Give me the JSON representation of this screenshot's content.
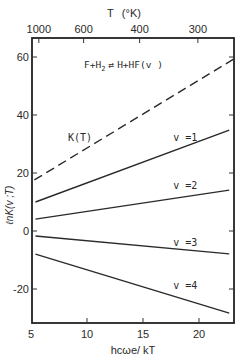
{
  "chart_data": {
    "type": "line",
    "xlabel": "hcωe/ kT",
    "ylabel": "ℓnK(v ;T)",
    "top_axis_label": "T  (°K)",
    "xlim": [
      5,
      23.1
    ],
    "ylim": [
      -34,
      66.5
    ],
    "grid": false,
    "legend": "inline labels",
    "x_ticks": [
      5,
      10,
      15,
      20
    ],
    "y_ticks": [
      -20,
      0,
      20,
      40,
      60
    ],
    "top_ticks": [
      {
        "label": "1000",
        "x": 5.7
      },
      {
        "label": "600",
        "x": 9.7
      },
      {
        "label": "400",
        "x": 14.7
      },
      {
        "label": "300",
        "x": 19.9
      }
    ],
    "series": [
      {
        "name": "K(T)",
        "style": "dashed",
        "x": [
          5.3,
          23.1
        ],
        "values": [
          17.6,
          59.3
        ],
        "label_pos": [
          8.3,
          31
        ]
      },
      {
        "name": "v =1",
        "style": "solid",
        "x": [
          5.4,
          22.7
        ],
        "values": [
          10.0,
          34.8
        ],
        "label_pos": [
          17.7,
          31
        ]
      },
      {
        "name": "v =2",
        "style": "solid",
        "x": [
          5.4,
          22.7
        ],
        "values": [
          4.1,
          14.1
        ],
        "label_pos": [
          17.7,
          14.5
        ]
      },
      {
        "name": "v =3",
        "style": "solid",
        "x": [
          5.4,
          22.7
        ],
        "values": [
          -1.7,
          -7.9
        ],
        "label_pos": [
          17.7,
          -5
        ]
      },
      {
        "name": "v =4",
        "style": "solid",
        "x": [
          5.4,
          22.7
        ],
        "values": [
          -8.0,
          -28.3
        ],
        "label_pos": [
          17.7,
          -20
        ]
      }
    ]
  },
  "labels": {
    "top_axis_title": "T",
    "top_axis_unit": "(°K)",
    "reaction_left": "F+H",
    "reaction_sub": "2",
    "reaction_arrows": "⇄",
    "reaction_right": "H+HF(v )",
    "xlabel": "hcωe/ kT",
    "ylabel": "ℓnK(v ;T)"
  }
}
